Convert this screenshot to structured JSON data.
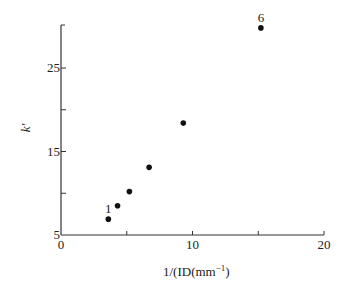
{
  "chart_data": {
    "type": "scatter",
    "title": "",
    "xlabel": "1/(ID(mm⁻¹)",
    "ylabel": "k′",
    "xlim": [
      0,
      20
    ],
    "ylim": [
      5,
      30
    ],
    "x_ticks": [
      0,
      5,
      10,
      15,
      20
    ],
    "x_tick_labels": [
      "0",
      "",
      "10",
      "",
      "20"
    ],
    "y_ticks": [
      5,
      10,
      15,
      20,
      25,
      30
    ],
    "y_tick_labels": [
      "5",
      "",
      "15",
      "",
      "25",
      ""
    ],
    "grid": false,
    "legend": null,
    "series": [
      {
        "name": "k' vs 1/ID",
        "points": [
          {
            "label": "1",
            "x": 3.6,
            "y": 6.9
          },
          {
            "label": "",
            "x": 4.3,
            "y": 8.5
          },
          {
            "label": "",
            "x": 5.2,
            "y": 10.2
          },
          {
            "label": "",
            "x": 6.7,
            "y": 13.1
          },
          {
            "label": "",
            "x": 9.3,
            "y": 18.4
          },
          {
            "label": "6",
            "x": 15.2,
            "y": 29.8
          }
        ]
      }
    ],
    "annotations": [
      {
        "text": "1",
        "near_point": 0
      },
      {
        "text": "6",
        "near_point": 5
      }
    ]
  }
}
